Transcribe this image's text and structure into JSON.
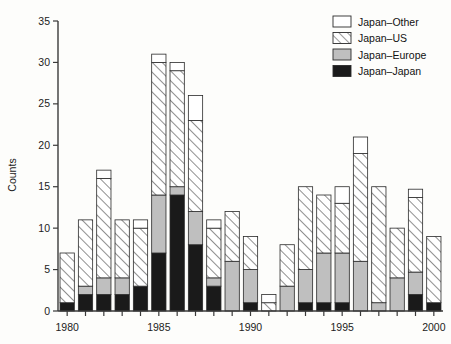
{
  "figure": {
    "background_color": "#fdfdfb",
    "axis_color": "#3a3a3a"
  },
  "axes": {
    "ylabel": "Counts",
    "y_ticks": [
      "0",
      "5",
      "10",
      "15",
      "20",
      "25",
      "30",
      "35"
    ],
    "x_ticks_labeled": [
      "1980",
      "1985",
      "1990",
      "1995",
      "2000"
    ]
  },
  "legend": {
    "position": "top-right",
    "entries": [
      {
        "label": "Japan–Other",
        "key": "other",
        "color": "#ffffff",
        "pattern": "solid-white"
      },
      {
        "label": "Japan–US",
        "key": "us",
        "color": "#ffffff",
        "pattern": "diagonal-hatch"
      },
      {
        "label": "Japan–Europe",
        "key": "europe",
        "color": "#bfbfbf",
        "pattern": "solid-gray"
      },
      {
        "label": "Japan–Japan",
        "key": "japan",
        "color": "#1a1a1a",
        "pattern": "solid-black"
      }
    ]
  },
  "chart_data": {
    "type": "bar",
    "stacked": true,
    "title": "",
    "xlabel": "",
    "ylabel": "Counts",
    "ylim": [
      0,
      35
    ],
    "xlim": [
      1979.5,
      2000.5
    ],
    "grid": false,
    "legend_position": "top-right",
    "categories": [
      "1980",
      "1981",
      "1982",
      "1983",
      "1984",
      "1985",
      "1986",
      "1987",
      "1988",
      "1989",
      "1990",
      "1991",
      "1992",
      "1993",
      "1994",
      "1995",
      "1996",
      "1997",
      "1998",
      "1999",
      "2000"
    ],
    "series": [
      {
        "name": "Japan–Japan",
        "color": "#1a1a1a",
        "pattern": "solid-black",
        "values": [
          1,
          2,
          2,
          2,
          3,
          7,
          14,
          8,
          3,
          0,
          1,
          0,
          0,
          1,
          1,
          1,
          0,
          0,
          0,
          2,
          1
        ]
      },
      {
        "name": "Japan–Europe",
        "color": "#bfbfbf",
        "pattern": "solid-gray",
        "values": [
          0,
          1,
          2,
          2,
          0,
          7,
          1,
          4,
          1,
          6,
          4,
          0,
          3,
          4,
          6,
          6,
          6,
          1,
          4,
          2.7,
          0
        ]
      },
      {
        "name": "Japan–US",
        "color": "#ffffff",
        "pattern": "diagonal-hatch",
        "values": [
          6,
          8,
          12,
          7,
          7,
          16,
          14,
          11,
          6,
          6,
          4,
          1,
          5,
          10,
          7,
          6,
          13,
          14,
          6,
          9,
          8
        ]
      },
      {
        "name": "Japan–Other",
        "color": "#ffffff",
        "pattern": "solid-white",
        "values": [
          0,
          0,
          1,
          0,
          1,
          1,
          1,
          3,
          1,
          0,
          0,
          1,
          0,
          0,
          0,
          2,
          2,
          0,
          0,
          1,
          0
        ]
      }
    ],
    "totals": [
      7,
      11,
      17,
      11,
      11,
      31,
      30,
      26,
      11,
      12,
      9,
      2,
      8,
      15,
      14,
      15,
      21,
      15,
      10,
      14.7,
      9
    ]
  }
}
